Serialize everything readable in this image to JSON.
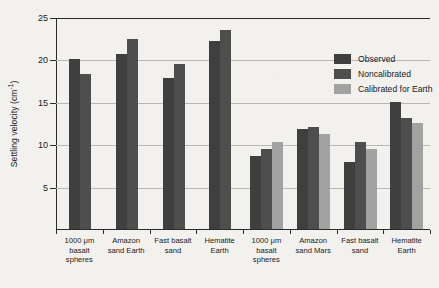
{
  "chart_data": {
    "type": "bar",
    "title": "",
    "xlabel": "",
    "ylabel": "Settling velocity (cm",
    "ylabel_sup": "-1",
    "ylabel_tail": ")",
    "ylim": [
      0,
      25
    ],
    "yticks": [
      25,
      20,
      15,
      10,
      5
    ],
    "grid": true,
    "legend_position": "top-right-inside",
    "categories": [
      "1000 μm basalt spheres",
      "Amazon sand Earth",
      "Fast basalt sand",
      "Hematite Earth",
      "1000 μm basalt spheres",
      "Amazon sand Mars",
      "Fast basalt sand",
      "Hematite Earth"
    ],
    "category_lines": [
      [
        "1000 μm",
        "basalt",
        "spheres"
      ],
      [
        "Amazon",
        "sand Earth"
      ],
      [
        "Fast basalt",
        "sand"
      ],
      [
        "Hematite",
        "Earth"
      ],
      [
        "1000 μm",
        "basalt",
        "spheres"
      ],
      [
        "Amazon",
        "sand Mars"
      ],
      [
        "Fast basalt",
        "sand"
      ],
      [
        "Hematite",
        "Earth"
      ]
    ],
    "series": [
      {
        "name": "Observed",
        "color": "#3f3f3f",
        "values": [
          20.1,
          20.7,
          17.9,
          22.3,
          8.7,
          11.9,
          7.9,
          15.1
        ]
      },
      {
        "name": "Noncalibrated",
        "color": "#4e4e4e",
        "values": [
          18.4,
          22.5,
          19.6,
          23.6,
          9.5,
          12.1,
          10.3,
          13.1
        ]
      },
      {
        "name": "Calibrated for Earth",
        "color": "#a2a2a2",
        "values": [
          null,
          null,
          null,
          null,
          10.3,
          11.2,
          9.5,
          12.6
        ]
      }
    ],
    "legend": [
      {
        "label": "Observed",
        "swatch": "observed"
      },
      {
        "label": "Noncalibrated",
        "swatch": "noncal"
      },
      {
        "label": "Calibrated for Earth",
        "swatch": "calib"
      }
    ]
  }
}
